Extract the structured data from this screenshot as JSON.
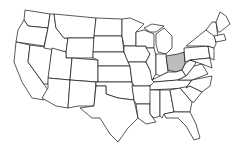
{
  "map": {
    "type": "us-states-outline",
    "highlighted_state": "Ohio",
    "highlight_color": "#bdbdbd",
    "base_fill": "#ffffff",
    "stroke_color": "#111111"
  }
}
